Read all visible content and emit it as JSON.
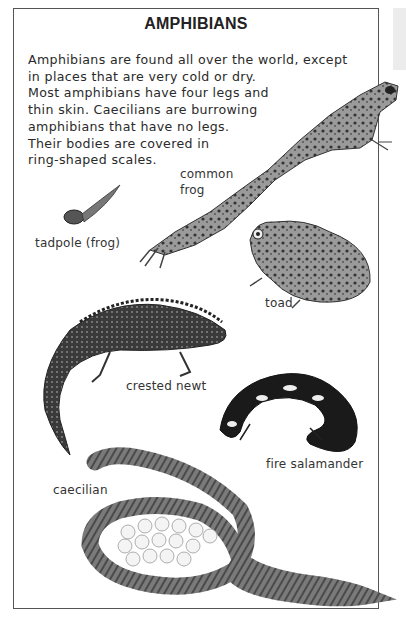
{
  "page": {
    "title": "AMPHIBIANS",
    "intro_lines": [
      "Amphibians are found all over the world, except",
      "in places that are very cold or dry.",
      "Most amphibians have four legs and",
      "thin skin. Caecilians are burrowing",
      "amphibians that have no legs.",
      "Their bodies are covered in",
      "ring-shaped scales."
    ]
  },
  "labels": {
    "common_frog_line1": "common",
    "common_frog_line2": "frog",
    "tadpole": "tadpole (frog)",
    "toad": "toad",
    "crested_newt": "crested newt",
    "fire_salamander": "fire salamander",
    "caecilian": "caecilian"
  },
  "colors": {
    "frame_border": "#555555",
    "text": "#2a2a2a",
    "side_tab": "#ececec"
  }
}
